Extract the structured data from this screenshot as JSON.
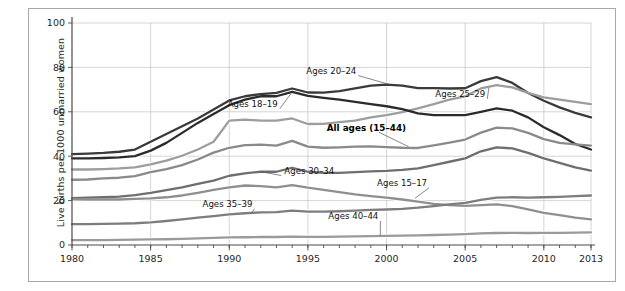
{
  "figure": {
    "background_color": "#ffffff",
    "border_color": "#a8a8a8"
  },
  "chart_data": {
    "type": "line",
    "title": "",
    "subtitle": "",
    "xlabel": "",
    "ylabel": "Live births per 1000 unmarried women",
    "xlim": [
      1980,
      2013
    ],
    "ylim": [
      0,
      100
    ],
    "grid": true,
    "legend_position": "inline-annotations",
    "x_tick_labels": [
      "1980",
      "1985",
      "1990",
      "1995",
      "2000",
      "2005",
      "2010",
      "2013"
    ],
    "x_tick_values": [
      1980,
      1985,
      1990,
      1995,
      2000,
      2005,
      2010,
      2013
    ],
    "x_minor_ticks_every": 1,
    "y_tick_labels": [
      "0",
      "20",
      "40",
      "60",
      "80",
      "100"
    ],
    "y_tick_values": [
      0,
      20,
      40,
      60,
      80,
      100
    ],
    "x": [
      1980,
      1981,
      1982,
      1983,
      1984,
      1985,
      1986,
      1987,
      1988,
      1989,
      1990,
      1991,
      1992,
      1993,
      1994,
      1995,
      1996,
      1997,
      1998,
      1999,
      2000,
      2001,
      2002,
      2003,
      2004,
      2005,
      2006,
      2007,
      2008,
      2009,
      2010,
      2011,
      2012,
      2013
    ],
    "series": [
      {
        "name": "Ages 20-24",
        "label": "Ages 20–24",
        "color": "#3a3a3a",
        "bold": false,
        "values": [
          40.9,
          41.2,
          41.5,
          42.0,
          43.0,
          46.5,
          50.0,
          53.5,
          57.0,
          61.0,
          65.1,
          67.0,
          68.0,
          68.5,
          70.5,
          68.7,
          68.6,
          69.3,
          70.5,
          71.8,
          72.2,
          71.8,
          70.7,
          70.7,
          70.5,
          70.6,
          73.8,
          75.6,
          73.0,
          68.5,
          65.0,
          62.0,
          59.5,
          57.5
        ]
      },
      {
        "name": "Ages 25-29",
        "label": "Ages 25–29",
        "color": "#9d9d9d",
        "bold": false,
        "values": [
          34.0,
          34.0,
          34.2,
          34.5,
          35.0,
          36.3,
          38.0,
          40.2,
          43.0,
          46.5,
          56.0,
          56.5,
          56.0,
          56.0,
          57.0,
          54.5,
          54.6,
          55.3,
          56.0,
          57.5,
          58.5,
          59.8,
          61.5,
          63.5,
          65.5,
          67.0,
          70.5,
          72.0,
          71.0,
          68.5,
          66.5,
          65.5,
          64.5,
          63.5
        ]
      },
      {
        "name": "Ages 18-19",
        "label": "Ages 18–19",
        "color": "#2b2b2b",
        "bold": false,
        "values": [
          39.0,
          39.0,
          39.2,
          39.5,
          40.0,
          42.5,
          46.0,
          50.5,
          55.0,
          59.0,
          63.0,
          65.5,
          67.0,
          67.0,
          69.0,
          67.2,
          66.3,
          65.5,
          64.5,
          63.5,
          62.5,
          61.2,
          59.3,
          58.5,
          58.5,
          58.5,
          60.0,
          61.5,
          60.5,
          57.5,
          53.0,
          49.5,
          45.5,
          43.0
        ]
      },
      {
        "name": "All ages (15-44)",
        "label": "All ages (15–44)",
        "color": "#8a8a8a",
        "bold": true,
        "values": [
          29.4,
          29.5,
          30.0,
          30.3,
          31.0,
          32.8,
          34.2,
          36.0,
          38.5,
          41.6,
          43.8,
          45.0,
          45.2,
          44.8,
          46.9,
          44.3,
          43.8,
          44.0,
          44.3,
          44.4,
          44.1,
          43.8,
          43.7,
          44.9,
          46.1,
          47.5,
          50.6,
          52.9,
          52.5,
          50.5,
          47.7,
          46.0,
          45.3,
          44.8
        ]
      },
      {
        "name": "Ages 30-34",
        "label": "Ages 30–34",
        "color": "#6e6e6e",
        "bold": false,
        "values": [
          21.1,
          21.3,
          21.5,
          21.8,
          22.5,
          23.5,
          24.7,
          26.0,
          27.5,
          29.0,
          31.2,
          32.3,
          33.0,
          33.0,
          34.8,
          33.0,
          32.5,
          32.5,
          32.8,
          33.2,
          33.4,
          33.8,
          34.5,
          36.0,
          37.5,
          39.0,
          42.2,
          44.0,
          43.5,
          41.5,
          39.0,
          37.0,
          35.0,
          33.5
        ]
      },
      {
        "name": "Ages 15-17",
        "label": "Ages 15–17",
        "color": "#8f8f8f",
        "bold": false,
        "values": [
          20.6,
          20.5,
          20.5,
          20.5,
          20.8,
          21.0,
          21.5,
          22.3,
          23.5,
          24.8,
          26.0,
          26.8,
          26.5,
          26.0,
          27.0,
          25.8,
          24.8,
          23.8,
          22.8,
          22.0,
          21.3,
          20.5,
          19.5,
          18.5,
          18.0,
          17.6,
          18.0,
          18.3,
          17.5,
          16.0,
          14.5,
          13.5,
          12.3,
          11.5
        ]
      },
      {
        "name": "Ages 35-39",
        "label": "Ages 35–39",
        "color": "#7d7d7d",
        "bold": false,
        "values": [
          9.4,
          9.4,
          9.5,
          9.6,
          9.8,
          10.2,
          10.8,
          11.5,
          12.3,
          13.0,
          13.8,
          14.3,
          14.7,
          14.8,
          15.5,
          15.0,
          15.0,
          15.2,
          15.5,
          15.8,
          16.0,
          16.3,
          16.8,
          17.5,
          18.3,
          19.0,
          20.3,
          21.3,
          21.5,
          21.3,
          21.5,
          21.7,
          22.0,
          22.3
        ]
      },
      {
        "name": "Ages 40-44",
        "label": "Ages 40–44",
        "color": "#9a9a9a",
        "bold": false,
        "values": [
          2.2,
          2.2,
          2.2,
          2.3,
          2.4,
          2.5,
          2.6,
          2.8,
          3.0,
          3.2,
          3.4,
          3.5,
          3.6,
          3.6,
          3.8,
          3.7,
          3.7,
          3.8,
          3.9,
          4.0,
          4.1,
          4.2,
          4.3,
          4.5,
          4.7,
          4.9,
          5.2,
          5.4,
          5.5,
          5.4,
          5.5,
          5.5,
          5.6,
          5.7
        ]
      }
    ],
    "annotations": [
      {
        "text": "Ages 20–24",
        "x": 1994.9,
        "y": 77.0,
        "anchor": "start",
        "bold": false,
        "leader_to_x": 2000.2,
        "leader_to_y": 72.3
      },
      {
        "text": "Ages 18–19",
        "x": 1989.9,
        "y": 62.0,
        "anchor": "start",
        "bold": false,
        "leader_to_x": 1993.9,
        "leader_to_y": 68.0
      },
      {
        "text": "Ages 25–29",
        "x": 2003.1,
        "y": 66.5,
        "anchor": "start",
        "bold": false,
        "leader_to_x": 2006.5,
        "leader_to_y": 70.7
      },
      {
        "text": "All ages (15–44)",
        "x": 1996.2,
        "y": 51.5,
        "anchor": "start",
        "bold": true,
        "leader_to_x": 2001.4,
        "leader_to_y": 44.3
      },
      {
        "text": "Ages 30–34",
        "x": 1993.5,
        "y": 32.0,
        "anchor": "start",
        "bold": false,
        "leader_to_x": 1992.0,
        "leader_to_y": 33.0
      },
      {
        "text": "Ages 15–17",
        "x": 1999.4,
        "y": 26.5,
        "anchor": "start",
        "bold": false,
        "leader_to_x": 2001.8,
        "leader_to_y": 21.0
      },
      {
        "text": "Ages 35–39",
        "x": 1988.3,
        "y": 17.0,
        "anchor": "start",
        "bold": false,
        "leader_to_x": 1991.4,
        "leader_to_y": 14.1
      },
      {
        "text": "Ages 40–44",
        "x": 1996.3,
        "y": 11.5,
        "anchor": "start",
        "bold": false,
        "leader_to_x": 1999.6,
        "leader_to_y": 4.2
      }
    ]
  }
}
